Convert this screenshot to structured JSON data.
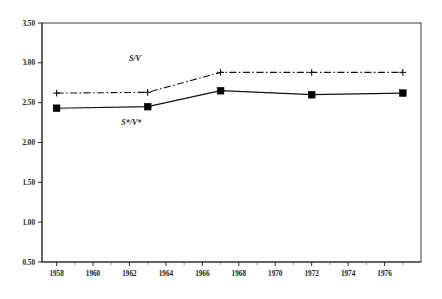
{
  "chart_data": {
    "type": "line",
    "title": "",
    "subtitle": "",
    "xlabel": "",
    "ylabel": "",
    "xlim": [
      1957.2,
      1978.0
    ],
    "ylim": [
      0.5,
      3.5
    ],
    "grid": false,
    "legend_position": "inline-annotation",
    "y_ticks": [
      "0.50",
      "1.00",
      "1.50",
      "2.00",
      "2.50",
      "3.00",
      "3.50"
    ],
    "y_tick_values": [
      0.5,
      1.0,
      1.5,
      2.0,
      2.5,
      3.0,
      3.5
    ],
    "x_ticks": [
      "1958",
      "1960",
      "1962",
      "1964",
      "1966",
      "1968",
      "1970",
      "1972",
      "1974",
      "1976"
    ],
    "x_tick_values": [
      1958,
      1960,
      1962,
      1964,
      1966,
      1968,
      1970,
      1972,
      1974,
      1976
    ],
    "x_minor_tick_values": [
      1959,
      1961,
      1963,
      1965,
      1967,
      1969,
      1971,
      1973,
      1975,
      1977
    ],
    "x": [
      1958,
      1963,
      1967,
      1972,
      1977
    ],
    "series": [
      {
        "name": "S/V",
        "label": "S/V",
        "style": "dash-dot",
        "marker": "plus",
        "color": "#111111",
        "values": [
          2.62,
          2.63,
          2.88,
          2.88,
          2.88
        ]
      },
      {
        "name": "S*/V*",
        "label": "S*/V*",
        "style": "solid",
        "marker": "filled-square",
        "color": "#111111",
        "values": [
          2.43,
          2.45,
          2.65,
          2.6,
          2.62
        ]
      }
    ],
    "annotations": [
      {
        "text": "S/V",
        "x": 1962.3,
        "y": 3.02
      },
      {
        "text": "S*/V*",
        "x": 1962.1,
        "y": 2.22
      }
    ]
  },
  "colors": {
    "background": "#ffffff",
    "axis": "#2b2b2b",
    "frame": "#3a3a3a",
    "series": "#111111"
  }
}
